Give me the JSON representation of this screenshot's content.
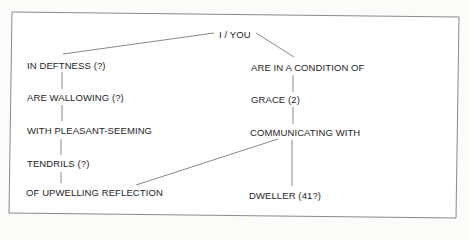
{
  "diagram": {
    "root": {
      "label": "I / YOU"
    },
    "left_branch": [
      {
        "label": "IN DEFTNESS (?)"
      },
      {
        "label": "ARE WALLOWING (?)"
      },
      {
        "label": "WITH PLEASANT-SEEMING"
      },
      {
        "label": "TENDRILS (?)"
      },
      {
        "label": "OF UPWELLING REFLECTION"
      }
    ],
    "right_branch": [
      {
        "label": "ARE IN A CONDITION OF"
      },
      {
        "label": "GRACE (2)"
      },
      {
        "label": "COMMUNICATING WITH"
      },
      {
        "label": "DWELLER (41?)"
      }
    ],
    "connections": [
      {
        "from": "I / YOU",
        "to": "IN DEFTNESS (?)"
      },
      {
        "from": "I / YOU",
        "to": "ARE IN A CONDITION OF"
      },
      {
        "from": "IN DEFTNESS (?)",
        "to": "ARE WALLOWING (?)"
      },
      {
        "from": "ARE WALLOWING (?)",
        "to": "WITH PLEASANT-SEEMING"
      },
      {
        "from": "WITH PLEASANT-SEEMING",
        "to": "TENDRILS (?)"
      },
      {
        "from": "TENDRILS (?)",
        "to": "OF UPWELLING REFLECTION"
      },
      {
        "from": "ARE IN A CONDITION OF",
        "to": "GRACE (2)"
      },
      {
        "from": "GRACE (2)",
        "to": "COMMUNICATING WITH"
      },
      {
        "from": "COMMUNICATING WITH",
        "to": "DWELLER (41?)"
      },
      {
        "from": "COMMUNICATING WITH",
        "to": "OF UPWELLING REFLECTION"
      }
    ],
    "colors": {
      "background": "#fbfbfa",
      "border": "#8a8a8a",
      "line": "#6a6a6a",
      "text": "#1e1e1e"
    }
  }
}
